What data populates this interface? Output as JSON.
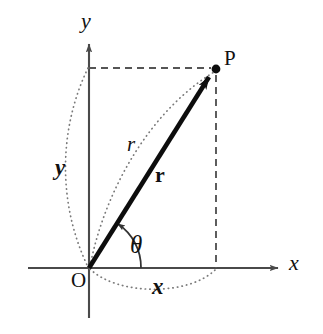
{
  "figure": {
    "kind": "polar-coordinates-diagram",
    "background_color": "#ffffff",
    "width": 323,
    "height": 334
  },
  "colors": {
    "axis": "#4a4a4a",
    "vector": "#0d0d0d",
    "dashed_guide": "#555555",
    "dotted_measure": "#777777",
    "text": "#111111"
  },
  "axes": {
    "x_axis": {
      "label": "x",
      "label_x": 292,
      "label_y": 255,
      "start_x": 28,
      "end_x": 278,
      "y": 268,
      "arrow": "right"
    },
    "y_axis": {
      "label": "y",
      "label_x": 81,
      "label_y": 14,
      "x": 89,
      "start_y": 318,
      "end_y": 44,
      "arrow": "up"
    }
  },
  "points": {
    "origin": {
      "label": "O",
      "x": 89,
      "y": 268,
      "label_x": 72,
      "label_y": 272
    },
    "p": {
      "label": "P",
      "x": 216,
      "y": 69,
      "dot_radius": 4.2,
      "label_x": 224,
      "label_y": 50
    }
  },
  "vector": {
    "label": "r",
    "label_style": "bold-roman",
    "label_x": 156,
    "label_y": 166,
    "from_x": 89,
    "from_y": 268,
    "to_x": 213,
    "to_y": 73,
    "stroke_width": 4.6
  },
  "angle": {
    "label": "θ",
    "label_x": 131,
    "label_y": 234,
    "arc_radius": 52,
    "vertex_x": 89,
    "vertex_y": 268,
    "start_deg": 0,
    "end_deg": 57.5
  },
  "measures": [
    {
      "name": "radial-distance",
      "label": "r",
      "label_style": "italic",
      "label_x": 127,
      "label_y": 136,
      "description": "dotted arc bowing left of the vector from O to P"
    },
    {
      "name": "y-component",
      "label": "y",
      "label_style": "bold-italic",
      "label_x": 56,
      "label_y": 159,
      "description": "dotted arc along the y-axis from O up to the height of P"
    },
    {
      "name": "x-component",
      "label": "x",
      "label_style": "bold-italic",
      "label_x": 153,
      "label_y": 278,
      "description": "dotted arc along the x-axis from O out to the abscissa of P"
    }
  ],
  "guides": [
    {
      "name": "horizontal-dashed-guide",
      "from_x": 89,
      "from_y": 68,
      "to_x": 212,
      "to_y": 68
    },
    {
      "name": "vertical-dashed-guide",
      "from_x": 216,
      "from_y": 74,
      "to_x": 216,
      "to_y": 268
    }
  ]
}
